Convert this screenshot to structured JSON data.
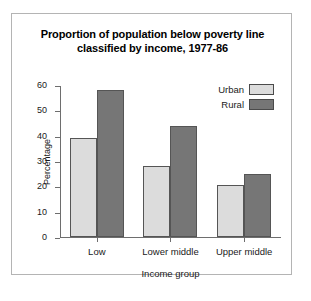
{
  "chart_data": {
    "type": "bar",
    "title": "Proportion of population below poverty line classified by income, 1977-86",
    "title_line1": "Proportion of population below poverty line",
    "title_line2": "classified by income, 1977-86",
    "xlabel": "Income group",
    "ylabel": "Percentage",
    "categories": [
      "Low",
      "Lower middle",
      "Upper middle"
    ],
    "series": [
      {
        "name": "Urban",
        "values": [
          39,
          28,
          20.5
        ],
        "color": "#dcdcdc"
      },
      {
        "name": "Rural",
        "values": [
          58,
          44,
          25
        ],
        "color": "#767676"
      }
    ],
    "ylim": [
      0,
      60
    ],
    "yticks": [
      0,
      10,
      20,
      30,
      40,
      50,
      60
    ],
    "ytick_labels": [
      "0",
      "10",
      "20",
      "30",
      "40",
      "50",
      "60"
    ],
    "grid": false,
    "legend_position": "top-right"
  },
  "colors": {
    "urban": "#dcdcdc",
    "rural": "#767676",
    "axis": "#6e6e6e",
    "frame": "#b4b4b4",
    "text": "#1a1a1a"
  }
}
